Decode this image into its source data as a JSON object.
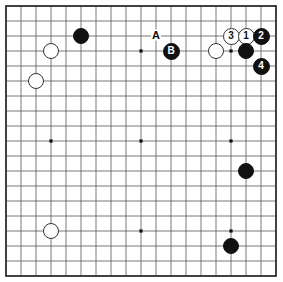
{
  "diagram": {
    "board_size": 19,
    "grid": {
      "origin_x": 6,
      "origin_y": 6,
      "spacing": 15,
      "line_color": "#555555",
      "border_color": "#333333",
      "background": "#ffffff",
      "star_points_cols": [
        3,
        9,
        15
      ],
      "star_points_rows": [
        3,
        9,
        15
      ]
    },
    "colors": {
      "black_stone": "#111111",
      "white_stone": "#ffffff",
      "white_stone_edge": "#333333",
      "label_text": "#111111"
    },
    "stones": [
      {
        "id": "black-d16",
        "color": "black",
        "col": 5,
        "row": 2,
        "label": ""
      },
      {
        "id": "white-c15",
        "color": "white",
        "col": 3,
        "row": 3,
        "label": ""
      },
      {
        "id": "white-b14",
        "color": "white",
        "col": 2,
        "row": 5,
        "label": ""
      },
      {
        "id": "black-b",
        "color": "black",
        "col": 11,
        "row": 3,
        "label": "B"
      },
      {
        "id": "white-o15",
        "color": "white",
        "col": 14,
        "row": 3,
        "label": ""
      },
      {
        "id": "white-move-3",
        "color": "white",
        "col": 15,
        "row": 2,
        "label": "3"
      },
      {
        "id": "white-move-1",
        "color": "white",
        "col": 16,
        "row": 2,
        "label": "1"
      },
      {
        "id": "black-move-2",
        "color": "black",
        "col": 17,
        "row": 2,
        "label": "2"
      },
      {
        "id": "black-q15",
        "color": "black",
        "col": 16,
        "row": 3,
        "label": ""
      },
      {
        "id": "black-move-4",
        "color": "black",
        "col": 17,
        "row": 4,
        "label": "4"
      },
      {
        "id": "black-q8",
        "color": "black",
        "col": 16,
        "row": 11,
        "label": ""
      },
      {
        "id": "white-c4",
        "color": "white",
        "col": 3,
        "row": 15,
        "label": ""
      },
      {
        "id": "black-q3",
        "color": "black",
        "col": 15,
        "row": 16,
        "label": ""
      }
    ],
    "point_labels": [
      {
        "id": "label-a",
        "text": "A",
        "col": 10,
        "row": 2
      }
    ]
  }
}
